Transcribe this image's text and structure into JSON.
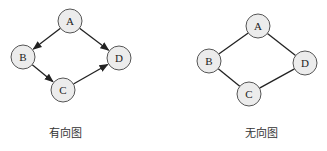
{
  "colors": {
    "node_fill": "#ececec",
    "node_stroke": "#555555",
    "edge": "#222222",
    "background": "#ffffff"
  },
  "diagrams": [
    {
      "caption": "有向图",
      "directed": true,
      "nodes": [
        {
          "id": "A",
          "label": "A",
          "x": 70,
          "y": 21
        },
        {
          "id": "B",
          "label": "B",
          "x": 23,
          "y": 57
        },
        {
          "id": "C",
          "label": "C",
          "x": 63,
          "y": 90
        },
        {
          "id": "D",
          "label": "D",
          "x": 119,
          "y": 58
        }
      ],
      "edges": [
        {
          "from": "A",
          "to": "B"
        },
        {
          "from": "A",
          "to": "D"
        },
        {
          "from": "B",
          "to": "C"
        },
        {
          "from": "C",
          "to": "D"
        }
      ],
      "caption_pos": {
        "x": 65,
        "y": 137
      }
    },
    {
      "caption": "无向图",
      "directed": false,
      "nodes": [
        {
          "id": "A",
          "label": "A",
          "x": 258,
          "y": 26
        },
        {
          "id": "B",
          "label": "B",
          "x": 209,
          "y": 61
        },
        {
          "id": "C",
          "label": "C",
          "x": 249,
          "y": 94
        },
        {
          "id": "D",
          "label": "D",
          "x": 305,
          "y": 63
        }
      ],
      "edges": [
        {
          "from": "A",
          "to": "B"
        },
        {
          "from": "A",
          "to": "D"
        },
        {
          "from": "B",
          "to": "C"
        },
        {
          "from": "C",
          "to": "D"
        }
      ],
      "caption_pos": {
        "x": 261,
        "y": 137
      }
    }
  ]
}
